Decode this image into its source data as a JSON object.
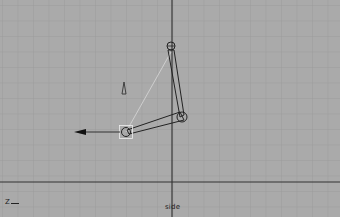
{
  "viewport": {
    "camera_label": "side",
    "axis_indicator": "Z",
    "background_color": "#aaaaaa",
    "grid_color": "#9a9a9a",
    "major_grid_color": "#8a8a8a",
    "axis_line_color": "#222222",
    "grid_spacing_px": 15.5
  },
  "scene": {
    "joints": [
      {
        "name": "top-joint",
        "x": 171,
        "y": 46
      },
      {
        "name": "middle-joint",
        "x": 182,
        "y": 117
      },
      {
        "name": "end-joint",
        "x": 126,
        "y": 132
      }
    ],
    "ik_handle": {
      "x": 126,
      "y": 132
    },
    "pole_vector": {
      "x": 124,
      "y": 88
    },
    "direction_arrow": {
      "from_x": 120,
      "to_x": 75,
      "y": 132
    }
  }
}
